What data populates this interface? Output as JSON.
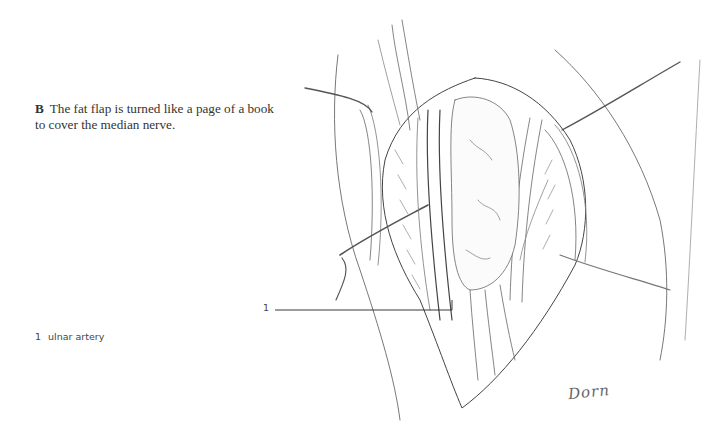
{
  "figure": {
    "panel_letter": "B",
    "caption_text": "The fat flap is turned like a page of a book to cover the median nerve.",
    "callout_label": "1",
    "legend": [
      {
        "number": "1",
        "label": "ulnar artery"
      }
    ],
    "signature": "Dorn",
    "illustration": "surgical-drawing-forearm-fat-flap-over-median-nerve"
  }
}
